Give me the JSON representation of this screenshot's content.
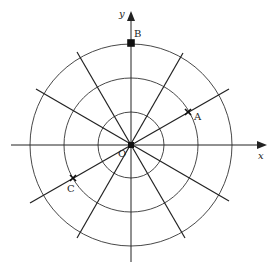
{
  "diagram": {
    "type": "polar-grid",
    "origin_label": "O",
    "x_axis_label": "x",
    "y_axis_label": "y",
    "circles": [
      1,
      2,
      3
    ],
    "ray_angles_deg": [
      0,
      30,
      60,
      90,
      120,
      150
    ],
    "points": [
      {
        "label": "A",
        "r": 2,
        "theta_deg": 30
      },
      {
        "label": "B",
        "r": 3,
        "theta_deg": 90
      },
      {
        "label": "C",
        "r": 2,
        "theta_deg": 210
      }
    ],
    "colors": {
      "line": "#222222",
      "background": "#ffffff"
    }
  },
  "labels": {
    "O": "O",
    "x": "x",
    "y": "y",
    "A": "A",
    "B": "B",
    "C": "C"
  }
}
